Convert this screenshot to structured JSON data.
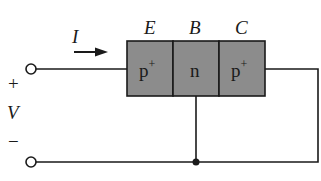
{
  "diagram": {
    "colors": {
      "semiconductor_fill": "#8c8c8c",
      "line": "#1a1a1a",
      "background": "#ffffff"
    },
    "terminal_labels": {
      "emitter": "E",
      "base": "B",
      "collector": "C"
    },
    "regions": [
      {
        "id": "emitter",
        "doping": "p",
        "superscript": "+"
      },
      {
        "id": "base",
        "doping": "n",
        "superscript": ""
      },
      {
        "id": "collector",
        "doping": "p",
        "superscript": "+"
      }
    ],
    "current": {
      "label": "I",
      "direction": "right"
    },
    "source": {
      "plus": "+",
      "label": "V",
      "minus": "−"
    }
  }
}
